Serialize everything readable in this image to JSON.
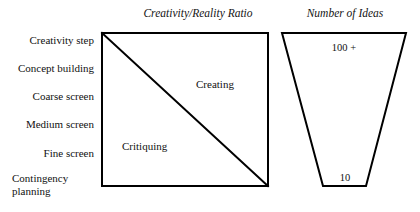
{
  "figure": {
    "background_color": "#ffffff",
    "stroke_color": "#000000",
    "text_color": "#111111"
  },
  "panels": {
    "ratio": {
      "title": "Creativity/Reality Ratio",
      "regions": [
        {
          "label": "Creating"
        },
        {
          "label": "Critiquing"
        }
      ]
    },
    "ideas": {
      "title": "Number of Ideas",
      "top_count": "100 +",
      "bottom_count": "10"
    }
  },
  "steps": [
    {
      "label": "Creativity step"
    },
    {
      "label": "Concept building"
    },
    {
      "label": "Coarse screen"
    },
    {
      "label": "Medium screen"
    },
    {
      "label": "Fine screen"
    },
    {
      "label": "Contingency planning"
    }
  ]
}
